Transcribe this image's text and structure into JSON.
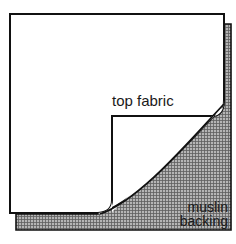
{
  "diagram": {
    "labels": {
      "top_fabric": "top fabric",
      "muslin_line1": "muslin",
      "muslin_line2": "backing"
    },
    "colors": {
      "outline": "#111111",
      "fabric_fill": "#ffffff",
      "muslin_fill": "#9a9a9a",
      "hatch": "#6e6e6e",
      "background": "#ffffff"
    }
  }
}
